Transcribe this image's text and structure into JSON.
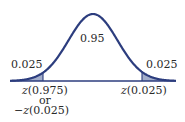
{
  "diagram": {
    "type": "normal-distribution",
    "center_area": "0.95",
    "left_tail_area": "0.025",
    "right_tail_area": "0.025",
    "left_label_line1_var": "z",
    "left_label_line1_arg": "(0.975)",
    "left_label_line2": "or",
    "left_label_line3_prefix": "−",
    "left_label_line3_var": "z",
    "left_label_line3_arg": "(0.025)",
    "right_label_var": "z",
    "right_label_arg": "(0.025)",
    "colors": {
      "curve": "#2c3d7e",
      "shade": "#a3aecb",
      "axis": "#2c3d7e"
    }
  }
}
